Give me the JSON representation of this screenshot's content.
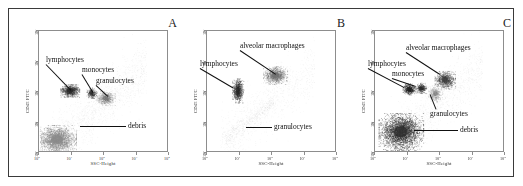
{
  "figure": {
    "panels": [
      {
        "letter": "A",
        "axes": {
          "xlabel": "SSC-Height",
          "ylabel": "CD45 FITC",
          "xticks": [
            "10^0",
            "10^1",
            "10^2",
            "10^3",
            "10^4"
          ],
          "yticks": [
            "10^0",
            "10^1",
            "10^2",
            "10^3",
            "10^4"
          ],
          "xlim": [
            0,
            4
          ],
          "ylim": [
            0,
            4
          ],
          "grid": false,
          "scale": "log-log"
        },
        "annotations": [
          {
            "label": "lymphocytes",
            "target": "lymphocyte-cluster"
          },
          {
            "label": "monocytes",
            "target": "monocyte-cluster"
          },
          {
            "label": "granulocytes",
            "target": "granulocyte-cluster"
          },
          {
            "label": "debris",
            "target": "debris-cluster"
          }
        ]
      },
      {
        "letter": "B",
        "axes": {
          "xlabel": "SSC-Height",
          "ylabel": "CD45 FITC",
          "xticks": [
            "10^0",
            "10^1",
            "10^2",
            "10^3",
            "10^4"
          ],
          "yticks": [
            "10^0",
            "10^1",
            "10^2",
            "10^3",
            "10^4"
          ],
          "xlim": [
            0,
            4
          ],
          "ylim": [
            0,
            4
          ],
          "grid": false,
          "scale": "log-log"
        },
        "annotations": [
          {
            "label": "alveolar macrophages",
            "target": "alveolar-macrophage-cluster"
          },
          {
            "label": "lymphocytes",
            "target": "lymphocyte-cluster"
          },
          {
            "label": "granulocytes",
            "target": "granulocyte-cluster"
          }
        ]
      },
      {
        "letter": "C",
        "axes": {
          "xlabel": "SSC-Height",
          "ylabel": "CD45 FITC",
          "xticks": [
            "10^0",
            "10^1",
            "10^2",
            "10^3",
            "10^4"
          ],
          "yticks": [
            "10^0",
            "10^1",
            "10^2",
            "10^3",
            "10^4"
          ],
          "xlim": [
            0,
            4
          ],
          "ylim": [
            0,
            4
          ],
          "grid": false,
          "scale": "log-log"
        },
        "annotations": [
          {
            "label": "alveolar macrophages",
            "target": "alveolar-macrophage-cluster"
          },
          {
            "label": "lymphocytes",
            "target": "lymphocyte-cluster"
          },
          {
            "label": "monocytes",
            "target": "monocyte-cluster"
          },
          {
            "label": "granulocytes",
            "target": "granulocyte-cluster"
          },
          {
            "label": "debris",
            "target": "debris-cluster"
          }
        ]
      }
    ]
  },
  "chart_data": [
    {
      "type": "scatter",
      "title": "A",
      "xlabel": "SSC-Height",
      "ylabel": "CD45 FITC",
      "xlim": [
        0,
        4
      ],
      "ylim": [
        0,
        4
      ],
      "xticks": [
        0,
        1,
        2,
        3,
        4
      ],
      "yticks": [
        0,
        1,
        2,
        3,
        4
      ],
      "xtick_labels": [
        "10^0",
        "10^1",
        "10^2",
        "10^3",
        "10^4"
      ],
      "ytick_labels": [
        "10^0",
        "10^1",
        "10^2",
        "10^3",
        "10^4"
      ],
      "grid": false,
      "scale": "log-log",
      "legend": "none",
      "populations": [
        {
          "name": "lymphocytes",
          "x": 0.95,
          "y": 2.05,
          "rx": 0.22,
          "ry": 0.16,
          "density": "high",
          "n": 900,
          "shade": "#2a2a2a"
        },
        {
          "name": "monocytes",
          "x": 1.62,
          "y": 1.97,
          "rx": 0.12,
          "ry": 0.13,
          "density": "high",
          "n": 320,
          "shade": "#2f2f2f"
        },
        {
          "name": "granulocytes",
          "x": 2.05,
          "y": 1.8,
          "rx": 0.22,
          "ry": 0.18,
          "density": "moderate",
          "n": 700,
          "shade": "#6b6b6b"
        },
        {
          "name": "debris",
          "x": 0.55,
          "y": 0.45,
          "rx": 0.45,
          "ry": 0.35,
          "density": "very-high",
          "n": 2400,
          "shade": "#8a8a8a"
        },
        {
          "name": "background",
          "x": 1.6,
          "y": 1.6,
          "rx": 1.4,
          "ry": 1.3,
          "density": "sparse",
          "n": 1500,
          "shade": "#9a9a9a"
        }
      ]
    },
    {
      "type": "scatter",
      "title": "B",
      "xlabel": "SSC-Height",
      "ylabel": "CD45 FITC",
      "xlim": [
        0,
        4
      ],
      "ylim": [
        0,
        4
      ],
      "xticks": [
        0,
        1,
        2,
        3,
        4
      ],
      "yticks": [
        0,
        1,
        2,
        3,
        4
      ],
      "xtick_labels": [
        "10^0",
        "10^1",
        "10^2",
        "10^3",
        "10^4"
      ],
      "ytick_labels": [
        "10^0",
        "10^1",
        "10^2",
        "10^3",
        "10^4"
      ],
      "grid": false,
      "scale": "log-log",
      "legend": "none",
      "populations": [
        {
          "name": "lymphocytes",
          "x": 0.95,
          "y": 2.05,
          "rx": 0.13,
          "ry": 0.3,
          "density": "high",
          "n": 850,
          "shade": "#262626"
        },
        {
          "name": "alveolar macrophages",
          "x": 2.1,
          "y": 2.55,
          "rx": 0.28,
          "ry": 0.22,
          "density": "high",
          "n": 1100,
          "shade": "#6f6f6f"
        },
        {
          "name": "granulocytes",
          "x": 1.1,
          "y": 0.95,
          "rx": 0.4,
          "ry": 0.3,
          "density": "sparse",
          "n": 450,
          "shade": "#8f8f8f"
        },
        {
          "name": "background",
          "x": 1.7,
          "y": 1.9,
          "rx": 1.2,
          "ry": 1.2,
          "density": "sparse",
          "n": 900,
          "shade": "#9a9a9a"
        }
      ]
    },
    {
      "type": "scatter",
      "title": "C",
      "xlabel": "SSC-Height",
      "ylabel": "CD45 FITC",
      "xlim": [
        0,
        4
      ],
      "ylim": [
        0,
        4
      ],
      "xticks": [
        0,
        1,
        2,
        3,
        4
      ],
      "yticks": [
        0,
        1,
        2,
        3,
        4
      ],
      "xtick_labels": [
        "10^0",
        "10^1",
        "10^2",
        "10^3",
        "10^4"
      ],
      "ytick_labels": [
        "10^0",
        "10^1",
        "10^2",
        "10^3",
        "10^4"
      ],
      "grid": false,
      "scale": "log-log",
      "legend": "none",
      "populations": [
        {
          "name": "lymphocytes",
          "x": 1.05,
          "y": 2.1,
          "rx": 0.15,
          "ry": 0.14,
          "density": "high",
          "n": 600,
          "shade": "#222222"
        },
        {
          "name": "monocytes",
          "x": 1.42,
          "y": 2.13,
          "rx": 0.12,
          "ry": 0.13,
          "density": "high",
          "n": 380,
          "shade": "#2b2b2b"
        },
        {
          "name": "alveolar macrophages",
          "x": 2.15,
          "y": 2.4,
          "rx": 0.24,
          "ry": 0.22,
          "density": "high",
          "n": 950,
          "shade": "#3d3d3d"
        },
        {
          "name": "granulocytes",
          "x": 1.85,
          "y": 1.95,
          "rx": 0.17,
          "ry": 0.2,
          "density": "moderate",
          "n": 500,
          "shade": "#7e7e7e"
        },
        {
          "name": "debris",
          "x": 0.8,
          "y": 0.7,
          "rx": 0.52,
          "ry": 0.46,
          "density": "very-high",
          "n": 3000,
          "shade": "#2e2e2e"
        },
        {
          "name": "background",
          "x": 1.6,
          "y": 1.6,
          "rx": 1.3,
          "ry": 1.3,
          "density": "sparse",
          "n": 1200,
          "shade": "#9a9a9a"
        }
      ]
    }
  ]
}
